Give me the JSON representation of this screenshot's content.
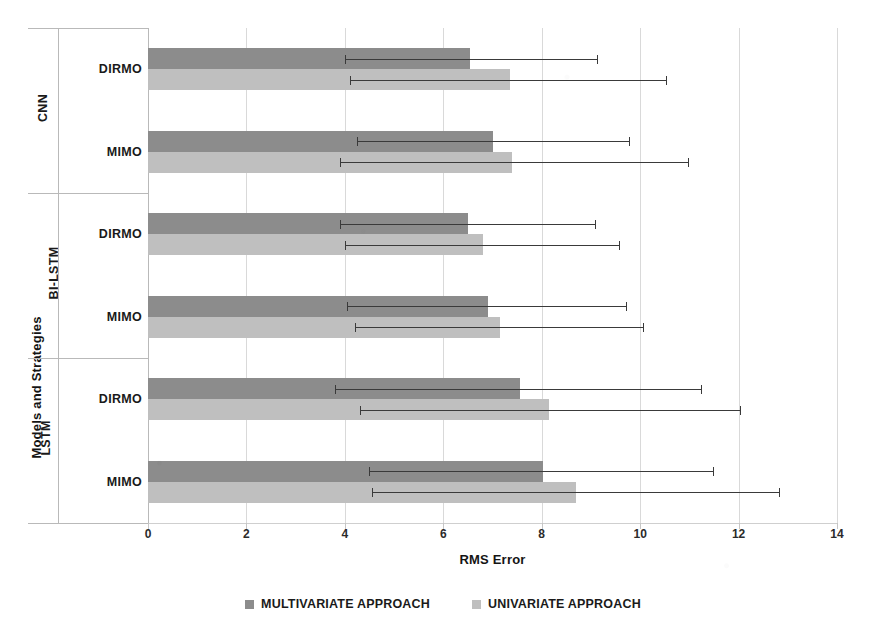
{
  "chart_data": {
    "type": "bar",
    "orientation": "horizontal",
    "title": "",
    "xlabel": "RMS Error",
    "ylabel": "Models and Strategies",
    "xlim": [
      0,
      14
    ],
    "xticks": [
      0,
      2,
      4,
      6,
      8,
      10,
      12,
      14
    ],
    "xtick_labels": [
      "0",
      "2",
      "4",
      "6",
      "8",
      "10",
      "12",
      "14"
    ],
    "grid": true,
    "grid_axis": "x",
    "legend_position": "bottom",
    "groups": [
      {
        "name": "CNN",
        "strategies": [
          {
            "name": "DIRMO",
            "bars": [
              {
                "series": "MULTIVARIATE APPROACH",
                "value": 6.55,
                "err_low": 4.0,
                "err_high": 9.15
              },
              {
                "series": "UNIVARIATE APPROACH",
                "value": 7.35,
                "err_low": 4.1,
                "err_high": 10.55
              }
            ]
          },
          {
            "name": "MIMO",
            "bars": [
              {
                "series": "MULTIVARIATE APPROACH",
                "value": 7.0,
                "err_low": 4.25,
                "err_high": 9.8
              },
              {
                "series": "UNIVARIATE APPROACH",
                "value": 7.4,
                "err_low": 3.9,
                "err_high": 11.0
              }
            ]
          }
        ]
      },
      {
        "name": "BI-LSTM",
        "strategies": [
          {
            "name": "DIRMO",
            "bars": [
              {
                "series": "MULTIVARIATE APPROACH",
                "value": 6.5,
                "err_low": 3.9,
                "err_high": 9.1
              },
              {
                "series": "UNIVARIATE APPROACH",
                "value": 6.8,
                "err_low": 4.0,
                "err_high": 9.6
              }
            ]
          },
          {
            "name": "MIMO",
            "bars": [
              {
                "series": "MULTIVARIATE APPROACH",
                "value": 6.9,
                "err_low": 4.05,
                "err_high": 9.73
              },
              {
                "series": "UNIVARIATE APPROACH",
                "value": 7.15,
                "err_low": 4.2,
                "err_high": 10.08
              }
            ]
          }
        ]
      },
      {
        "name": "LSTM",
        "strategies": [
          {
            "name": "DIRMO",
            "bars": [
              {
                "series": "MULTIVARIATE APPROACH",
                "value": 7.56,
                "err_low": 3.8,
                "err_high": 11.26
              },
              {
                "series": "UNIVARIATE APPROACH",
                "value": 8.15,
                "err_low": 4.3,
                "err_high": 12.05
              }
            ]
          },
          {
            "name": "MIMO",
            "bars": [
              {
                "series": "MULTIVARIATE APPROACH",
                "value": 8.03,
                "err_low": 4.5,
                "err_high": 11.5
              },
              {
                "series": "UNIVARIATE APPROACH",
                "value": 8.7,
                "err_low": 4.55,
                "err_high": 12.85
              }
            ]
          }
        ]
      }
    ],
    "series": [
      {
        "name": "MULTIVARIATE APPROACH",
        "color": "#8c8c8c"
      },
      {
        "name": "UNIVARIATE APPROACH",
        "color": "#bfbfbf"
      }
    ]
  },
  "legend": {
    "items": [
      {
        "label": "MULTIVARIATE APPROACH",
        "color": "#8c8c8c"
      },
      {
        "label": "UNIVARIATE APPROACH",
        "color": "#bfbfbf"
      }
    ]
  },
  "axes": {
    "x_title": "RMS Error",
    "y_title": "Models and Strategies"
  }
}
